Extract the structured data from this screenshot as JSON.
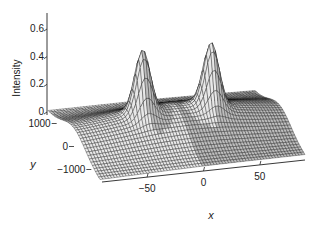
{
  "chart_data": {
    "type": "surface",
    "title": "",
    "xlabel": "x",
    "ylabel": "y",
    "zlabel": "Intensity",
    "xlim": [
      -90,
      90
    ],
    "ylim": [
      -1500,
      1500
    ],
    "zlim": [
      0,
      0.7
    ],
    "x_ticks": [
      -50,
      0,
      50
    ],
    "x_tick_labels": [
      "-50",
      "0",
      "50"
    ],
    "y_ticks": [
      1000,
      0,
      -1000
    ],
    "y_tick_labels": [
      "1000",
      "0",
      "-1000"
    ],
    "z_ticks": [
      0,
      0.2,
      0.4,
      0.6
    ],
    "z_tick_labels": [
      "0",
      "0.2",
      "0.4",
      "0.6"
    ],
    "surface": {
      "description": "Two narrow peaks on a broad ridge, peaks near y = 0",
      "peaks": [
        {
          "x": -30,
          "y": 0,
          "z": 0.6
        },
        {
          "x": 30,
          "y": 0,
          "z": 0.6
        }
      ],
      "base_ridge_height": 0.2,
      "mesh_color": "#111111",
      "face_color": "#ffffff"
    },
    "grid": false,
    "legend": "none"
  }
}
